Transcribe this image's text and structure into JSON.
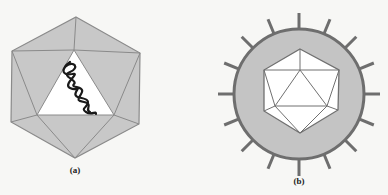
{
  "figures": [
    {
      "id": "a",
      "label": "(a)",
      "description": "Naked icosahedral capsid with nucleic acid",
      "colors": {
        "face": "#c8c8c8",
        "edge": "#8a8a8a",
        "window": "#ffffff",
        "nucleic_acid": "#1a1a1a"
      }
    },
    {
      "id": "b",
      "label": "(b)",
      "description": "Enveloped icosahedral virus with surface spikes",
      "colors": {
        "envelope": "#c4c4c4",
        "envelope_edge": "#6e6e6e",
        "spike": "#6e6e6e",
        "capsid_face": "#ffffff",
        "capsid_edge": "#707070"
      },
      "spike_count": 16
    }
  ]
}
